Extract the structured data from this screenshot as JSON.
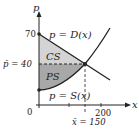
{
  "diagram": {
    "axes": {
      "x_label": "x",
      "y_label": "p",
      "origin_label": "0",
      "x_tick_label": "200",
      "y_tick_label": "70"
    },
    "curves": {
      "demand_label": "p = D(x)",
      "supply_label": "p = S(x)"
    },
    "regions": {
      "consumer_surplus": "CS",
      "producer_surplus": "PS"
    },
    "equilibrium": {
      "price_label": "p̄ = 40",
      "quantity_label": "x̄ = 150"
    },
    "colors": {
      "cs_fill": "#d4d4d4",
      "ps_fill": "#a8a8a8",
      "line": "#222222"
    }
  }
}
